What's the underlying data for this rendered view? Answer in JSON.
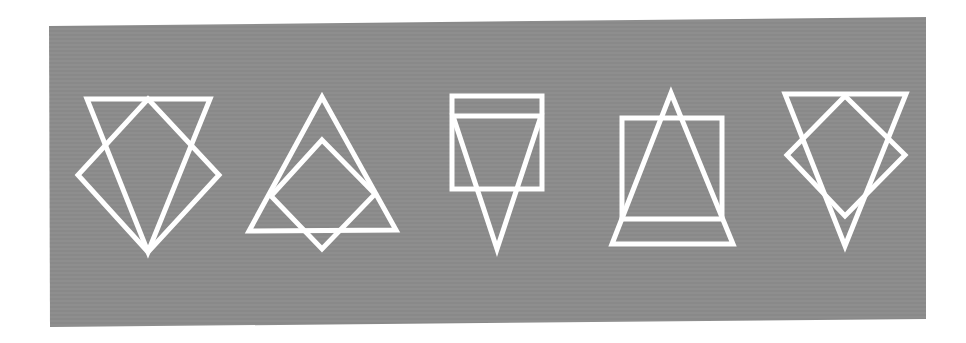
{
  "figure": {
    "background_color": "#ffffff",
    "panel": {
      "fill": "#8b8b8b",
      "corners": [
        [
          49,
          26
        ],
        [
          926,
          17
        ],
        [
          926,
          319
        ],
        [
          50,
          327
        ]
      ]
    },
    "stroke_color": "#ffffff",
    "stroke_width": 5,
    "figures": [
      {
        "id": "figure-1",
        "description": "inverted triangle overlapping a diamond",
        "shapes": [
          {
            "kind": "inverted-triangle",
            "points": [
              [
                87,
                99
              ],
              [
                210,
                99
              ],
              [
                148,
                252
              ]
            ]
          },
          {
            "kind": "diamond",
            "points": [
              [
                148,
                99
              ],
              [
                219,
                175
              ],
              [
                148,
                252
              ],
              [
                78,
                175
              ]
            ]
          }
        ]
      },
      {
        "id": "figure-2",
        "description": "upright triangle overlapping a diamond",
        "shapes": [
          {
            "kind": "triangle",
            "points": [
              [
                322,
                97
              ],
              [
                396,
                230
              ],
              [
                249,
                231
              ]
            ]
          },
          {
            "kind": "diamond",
            "points": [
              [
                322,
                140
              ],
              [
                375,
                194
              ],
              [
                322,
                249
              ],
              [
                271,
                196
              ]
            ]
          }
        ]
      },
      {
        "id": "figure-3",
        "description": "square with inverted triangle",
        "shapes": [
          {
            "kind": "square",
            "points": [
              [
                452,
                96
              ],
              [
                542,
                96
              ],
              [
                542,
                189
              ],
              [
                452,
                189
              ]
            ]
          },
          {
            "kind": "inverted-triangle",
            "points": [
              [
                453,
                116
              ],
              [
                541,
                116
              ],
              [
                497,
                249
              ]
            ]
          }
        ]
      },
      {
        "id": "figure-4",
        "description": "square with upright triangle",
        "shapes": [
          {
            "kind": "square",
            "points": [
              [
                622,
                118
              ],
              [
                722,
                118
              ],
              [
                722,
                219
              ],
              [
                622,
                219
              ]
            ]
          },
          {
            "kind": "triangle",
            "points": [
              [
                671,
                93
              ],
              [
                733,
                244
              ],
              [
                612,
                244
              ]
            ]
          }
        ]
      },
      {
        "id": "figure-5",
        "description": "inverted triangle overlapping a diamond",
        "shapes": [
          {
            "kind": "inverted-triangle",
            "points": [
              [
                785,
                94
              ],
              [
                906,
                94
              ],
              [
                845,
                246
              ]
            ]
          },
          {
            "kind": "diamond",
            "points": [
              [
                845,
                96
              ],
              [
                905,
                155
              ],
              [
                845,
                216
              ],
              [
                787,
                155
              ]
            ]
          }
        ]
      }
    ]
  }
}
